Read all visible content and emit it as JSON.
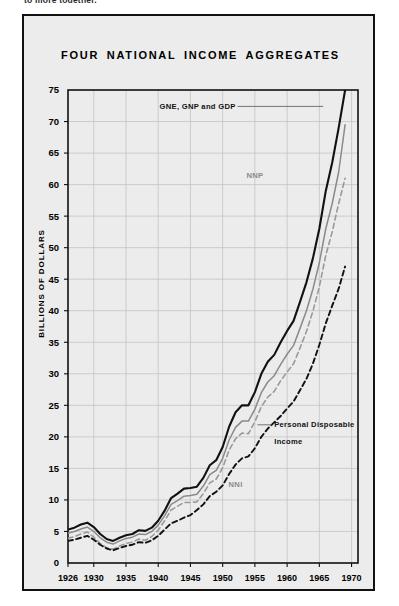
{
  "page": {
    "cut_off_text": "to more together."
  },
  "figure": {
    "title": "FOUR NATIONAL INCOME AGGREGATES"
  },
  "chart_data": {
    "type": "line",
    "title": "FOUR NATIONAL INCOME AGGREGATES",
    "xlabel": "",
    "ylabel": "BILLIONS OF DOLLARS",
    "xlim": [
      1926,
      1971
    ],
    "ylim": [
      0,
      75
    ],
    "ytick_step": 5,
    "yticks": [
      0,
      5,
      10,
      15,
      20,
      25,
      30,
      35,
      40,
      45,
      50,
      55,
      60,
      65,
      70,
      75
    ],
    "xticks": [
      1926,
      1930,
      1935,
      1940,
      1945,
      1950,
      1955,
      1960,
      1965,
      1970
    ],
    "grid": true,
    "legend_position": "inline-annotations",
    "x": [
      1926,
      1927,
      1928,
      1929,
      1930,
      1931,
      1932,
      1933,
      1934,
      1935,
      1936,
      1937,
      1938,
      1939,
      1940,
      1941,
      1942,
      1943,
      1944,
      1945,
      1946,
      1947,
      1948,
      1949,
      1950,
      1951,
      1952,
      1953,
      1954,
      1955,
      1956,
      1957,
      1958,
      1959,
      1960,
      1961,
      1962,
      1963,
      1964,
      1965,
      1966,
      1967,
      1968,
      1969
    ],
    "series": [
      {
        "name": "GNE, GNP and GDP",
        "style": "solid-thick-black",
        "color": "#111111",
        "label_x": 1952,
        "label_y": 72,
        "values": [
          5.3,
          5.6,
          6.1,
          6.4,
          5.7,
          4.6,
          3.8,
          3.5,
          4.0,
          4.4,
          4.6,
          5.2,
          5.1,
          5.6,
          6.7,
          8.3,
          10.3,
          11.0,
          11.8,
          11.9,
          12.1,
          13.5,
          15.5,
          16.3,
          18.4,
          21.6,
          23.9,
          25.0,
          25.0,
          27.1,
          30.0,
          31.9,
          33.0,
          35.0,
          36.8,
          38.4,
          41.4,
          44.5,
          48.3,
          53.0,
          59.0,
          63.5,
          69.0,
          75.0
        ]
      },
      {
        "name": "NNP",
        "style": "solid-thin-grey",
        "color": "#8a8a8a",
        "label_x": 1955,
        "label_y": 61,
        "values": [
          4.7,
          5.0,
          5.4,
          5.7,
          5.0,
          4.0,
          3.3,
          3.0,
          3.5,
          3.9,
          4.1,
          4.6,
          4.5,
          5.0,
          6.0,
          7.5,
          9.3,
          9.9,
          10.6,
          10.7,
          10.9,
          12.2,
          14.0,
          14.7,
          16.6,
          19.5,
          21.5,
          22.5,
          22.5,
          24.4,
          27.0,
          28.7,
          29.7,
          31.5,
          33.1,
          34.5,
          37.2,
          40.0,
          43.4,
          47.6,
          53.0,
          57.0,
          62.0,
          69.5
        ]
      },
      {
        "name": "NNI",
        "style": "dashed-grey",
        "color": "#9a9a9a",
        "label_x": 1952,
        "label_y": 12,
        "values": [
          3.9,
          4.2,
          4.6,
          4.9,
          4.1,
          3.1,
          2.4,
          2.2,
          2.7,
          3.1,
          3.3,
          3.8,
          3.6,
          4.2,
          5.2,
          6.7,
          8.4,
          9.0,
          9.6,
          9.6,
          9.7,
          11.0,
          12.7,
          13.3,
          15.1,
          17.9,
          19.7,
          20.6,
          20.5,
          22.4,
          24.8,
          26.3,
          27.2,
          28.9,
          30.3,
          31.6,
          34.1,
          36.7,
          39.9,
          43.8,
          48.8,
          52.5,
          57.0,
          61.0
        ]
      },
      {
        "name": "Personal Disposable Income",
        "style": "dashed-black",
        "color": "#111111",
        "label_x": 1958,
        "label_y": 21.5,
        "values": [
          3.5,
          3.7,
          4.0,
          4.3,
          3.7,
          2.9,
          2.3,
          2.0,
          2.4,
          2.7,
          2.9,
          3.3,
          3.2,
          3.6,
          4.3,
          5.3,
          6.3,
          6.7,
          7.2,
          7.6,
          8.4,
          9.3,
          10.6,
          11.3,
          12.3,
          14.1,
          15.6,
          16.6,
          16.9,
          18.2,
          20.0,
          21.3,
          22.3,
          23.3,
          24.5,
          25.6,
          27.4,
          29.2,
          31.6,
          34.6,
          38.0,
          40.8,
          43.5,
          47.0
        ]
      }
    ],
    "annotations": [
      {
        "text": "GNE, GNP and GDP",
        "leader": true
      },
      {
        "text": "NNP",
        "leader": false
      },
      {
        "text": "NNI",
        "leader": false
      },
      {
        "text": "Personal Disposable",
        "leader": true
      },
      {
        "text": "Income",
        "leader": false
      }
    ]
  }
}
